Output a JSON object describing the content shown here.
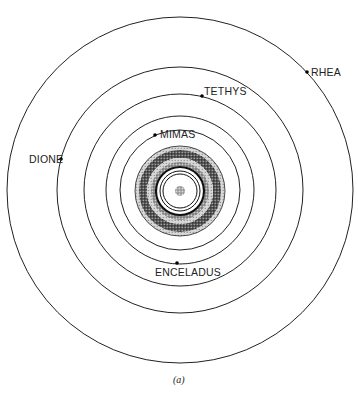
{
  "figure": {
    "caption": "(a)",
    "center": {
      "x": 180,
      "y": 190
    },
    "colors": {
      "ink": "#222222",
      "background": "#ffffff",
      "stipple_dark": "#333333",
      "stipple_light": "#9a9a9a"
    }
  },
  "moons": [
    {
      "name": "MIMAS",
      "orbit_radius": 60,
      "dot": {
        "x": 155,
        "y": 135
      },
      "label_pos": {
        "x": 160,
        "y": 129
      }
    },
    {
      "name": "ENCELADUS",
      "orbit_radius": 74,
      "dot": {
        "x": 177,
        "y": 263
      },
      "label_pos": {
        "x": 155,
        "y": 267
      }
    },
    {
      "name": "TETHYS",
      "orbit_radius": 96,
      "dot": {
        "x": 202,
        "y": 96
      },
      "label_pos": {
        "x": 204,
        "y": 86
      }
    },
    {
      "name": "DIONE",
      "orbit_radius": 123,
      "dot": {
        "x": 61,
        "y": 159
      },
      "label_pos": {
        "x": 29,
        "y": 154
      }
    },
    {
      "name": "RHEA",
      "orbit_radius": 173,
      "dot": {
        "x": 307,
        "y": 72
      },
      "label_pos": {
        "x": 311,
        "y": 67
      }
    }
  ],
  "rings": {
    "outer_radius": 45,
    "bands": [
      {
        "name": "outer-light-band",
        "r_outer": 45,
        "r_inner": 41,
        "shade": "light"
      },
      {
        "name": "outer-dark-band",
        "r_outer": 41,
        "r_inner": 33,
        "shade": "dark"
      },
      {
        "name": "middle-light-band",
        "r_outer": 33,
        "r_inner": 29,
        "shade": "light"
      },
      {
        "name": "inner-medium-band",
        "r_outer": 29,
        "r_inner": 25,
        "shade": "medium"
      }
    ],
    "lines": [
      24,
      20,
      17
    ],
    "planet_radius": 5
  }
}
